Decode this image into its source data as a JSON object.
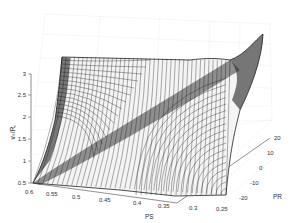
{
  "chart_data": {
    "type": "surface3d",
    "title": "",
    "xlabel": "PS",
    "ylabel": "PR",
    "zlabel": "vₛ/R꜀",
    "x_ticks": [
      "0.6",
      "0.55",
      "0.5",
      "0.45",
      "0.4",
      "0.35",
      "0.3",
      "0.25"
    ],
    "y_ticks": [
      "-20",
      "-10",
      "0",
      "10",
      "20"
    ],
    "z_ticks": [
      "0.5",
      "1",
      "1.5",
      "2",
      "2.5",
      "3"
    ],
    "xlim": [
      0.25,
      0.6
    ],
    "ylim": [
      -20,
      20
    ],
    "zlim": [
      0.5,
      3
    ],
    "grid": true,
    "style": "black wireframe mesh surface, rising steeply toward PS≈0.3 / PR≈20 corner (z≈3), minimum ≈0.5 at PS=0.6 / PR=-20"
  },
  "axes": {
    "x": {
      "label": "PS",
      "ticks": [
        "0.6",
        "0.55",
        "0.5",
        "0.45",
        "0.4",
        "0.35",
        "0.3",
        "0.25"
      ]
    },
    "y": {
      "label": "PR",
      "ticks": [
        "-20",
        "-10",
        "0",
        "10",
        "20"
      ]
    },
    "z": {
      "label": "vₛ/R꜀",
      "ticks": [
        "0.5",
        "1",
        "1.5",
        "2",
        "2.5",
        "3"
      ]
    }
  }
}
